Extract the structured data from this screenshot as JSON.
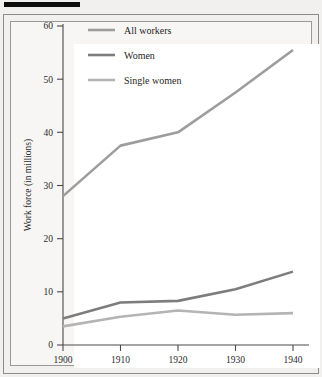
{
  "figure": {
    "background_color": "#f1f0ee",
    "plot_background_color": "#ffffff",
    "frame_color": "#8d8c8a",
    "top_rule_color": "#0d0d0d"
  },
  "chart_data": {
    "type": "line",
    "title": "",
    "xlabel": "",
    "ylabel": "Work force (in millions)",
    "categories": [
      "1900",
      "1910",
      "1920",
      "1930",
      "1940"
    ],
    "x": [
      1900,
      1910,
      1920,
      1930,
      1940
    ],
    "xlim": [
      1900,
      1940
    ],
    "ylim": [
      0,
      60
    ],
    "xticks": [
      "1900",
      "1910",
      "1920",
      "1930",
      "1940"
    ],
    "yticks": [
      "0",
      "10",
      "20",
      "30",
      "40",
      "50",
      "60"
    ],
    "ytick_values": [
      0,
      10,
      20,
      30,
      40,
      50,
      60
    ],
    "grid": false,
    "legend_position": "upper-left-inside",
    "series": [
      {
        "name": "All workers",
        "color": "#9d9d9d",
        "width": 2.6,
        "values": [
          28.0,
          37.5,
          40.0,
          47.5,
          55.5
        ]
      },
      {
        "name": "Women",
        "color": "#7d7d7d",
        "width": 2.6,
        "values": [
          5.0,
          8.0,
          8.3,
          10.5,
          13.8
        ]
      },
      {
        "name": "Single women",
        "color": "#b4b4b4",
        "width": 2.6,
        "values": [
          3.5,
          5.3,
          6.5,
          5.7,
          6.0
        ]
      }
    ]
  },
  "legend": {
    "items": [
      {
        "label": "All workers",
        "color": "#9d9d9d"
      },
      {
        "label": "Women",
        "color": "#7d7d7d"
      },
      {
        "label": "Single women",
        "color": "#b4b4b4"
      }
    ]
  },
  "axes": {
    "y_title": "Work force (in millions)",
    "y_tick_labels": [
      "60",
      "50",
      "40",
      "30",
      "20",
      "10",
      "0"
    ],
    "x_tick_labels": [
      "1900",
      "1910",
      "1920",
      "1930",
      "1940"
    ]
  }
}
